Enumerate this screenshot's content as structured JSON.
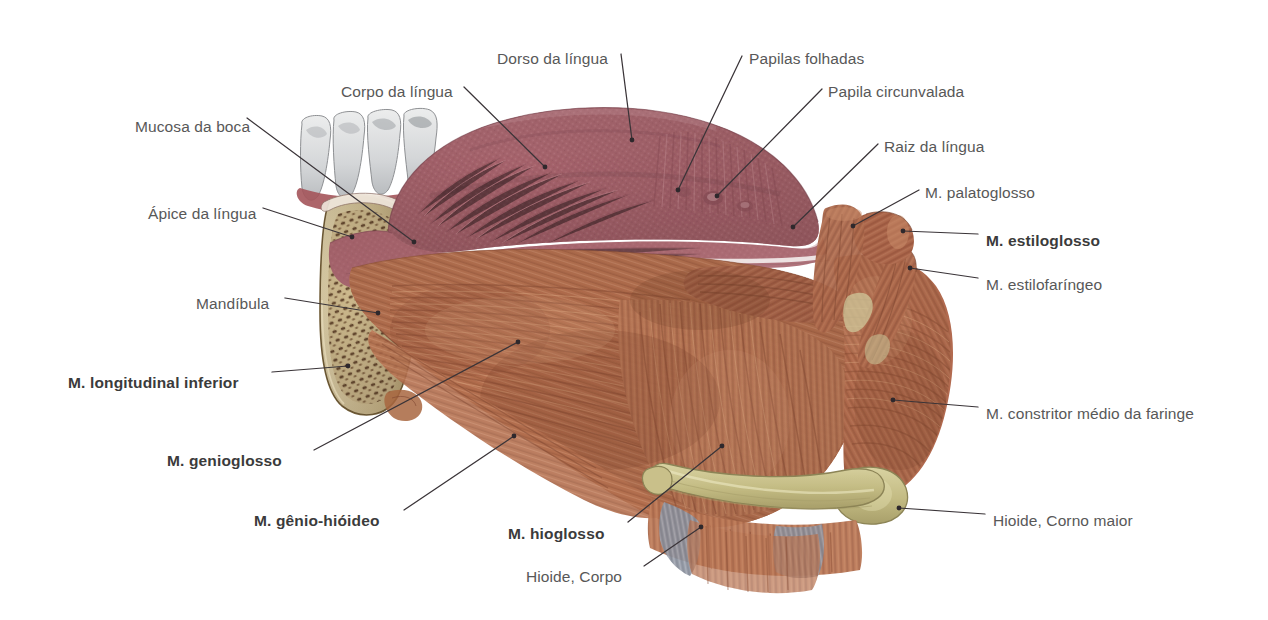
{
  "figure": {
    "language": "pt-BR",
    "background_color": "#ffffff",
    "label_color": "#585858",
    "bold_label_color": "#3b3b3b",
    "leader_line_color": "#3a3438"
  },
  "labels": [
    {
      "id": "mucosa-da-boca",
      "text": "Mucosa da boca",
      "bold": false,
      "x": 135,
      "y": 118,
      "align": "left",
      "leader": [
        [
          247,
          118
        ],
        [
          414,
          242
        ]
      ],
      "dot": true
    },
    {
      "id": "corpo-da-lingua",
      "text": "Corpo da língua",
      "bold": false,
      "x": 341,
      "y": 83,
      "align": "left",
      "leader": [
        [
          464,
          87
        ],
        [
          545,
          167
        ]
      ],
      "dot": true
    },
    {
      "id": "dorso-da-lingua",
      "text": "Dorso da língua",
      "bold": false,
      "x": 497,
      "y": 50,
      "align": "left",
      "leader": [
        [
          621,
          54
        ],
        [
          632,
          140
        ]
      ],
      "dot": true
    },
    {
      "id": "papilas-folhadas",
      "text": "Papilas folhadas",
      "bold": false,
      "x": 749,
      "y": 50,
      "align": "left",
      "leader": [
        [
          742,
          56
        ],
        [
          678,
          190
        ]
      ],
      "dot": true
    },
    {
      "id": "papila-circunvalada",
      "text": "Papila circunvalada",
      "bold": false,
      "x": 828,
      "y": 83,
      "align": "left",
      "leader": [
        [
          822,
          89
        ],
        [
          717,
          196
        ]
      ],
      "dot": true
    },
    {
      "id": "raiz-da-lingua",
      "text": "Raiz da língua",
      "bold": false,
      "x": 884,
      "y": 138,
      "align": "left",
      "leader": [
        [
          878,
          144
        ],
        [
          793,
          227
        ]
      ],
      "dot": true
    },
    {
      "id": "apice-da-lingua",
      "text": "Ápice da língua",
      "bold": false,
      "x": 148,
      "y": 205,
      "align": "left",
      "leader": [
        [
          263,
          208
        ],
        [
          352,
          237
        ]
      ],
      "dot": true
    },
    {
      "id": "m-palatoglosso",
      "text": "M. palatoglosso",
      "bold": false,
      "x": 925,
      "y": 184,
      "align": "left",
      "leader": [
        [
          919,
          190
        ],
        [
          853,
          226
        ]
      ],
      "dot": true
    },
    {
      "id": "m-estiloglosso",
      "text": "M. estiloglosso",
      "bold": true,
      "x": 986,
      "y": 232,
      "align": "left",
      "leader": [
        [
          978,
          234
        ],
        [
          903,
          231
        ]
      ],
      "dot": true
    },
    {
      "id": "m-estilofaringeo",
      "text": "M. estilofaríngeo",
      "bold": false,
      "x": 986,
      "y": 276,
      "align": "left",
      "leader": [
        [
          978,
          278
        ],
        [
          910,
          268
        ]
      ],
      "dot": true
    },
    {
      "id": "mandibula",
      "text": "Mandíbula",
      "bold": false,
      "x": 196,
      "y": 295,
      "align": "left",
      "leader": [
        [
          285,
          298
        ],
        [
          378,
          313
        ]
      ],
      "dot": true
    },
    {
      "id": "m-longitudinal-inferior",
      "text": "M. longitudinal inferior",
      "bold": true,
      "x": 68,
      "y": 374,
      "align": "left",
      "leader": [
        [
          272,
          372
        ],
        [
          348,
          366
        ]
      ],
      "dot": true
    },
    {
      "id": "m-constritor-medio",
      "text": "M. constritor médio da faringe",
      "bold": false,
      "x": 986,
      "y": 405,
      "align": "left",
      "leader": [
        [
          978,
          407
        ],
        [
          893,
          400
        ]
      ],
      "dot": true
    },
    {
      "id": "m-genioglosso",
      "text": "M. genioglosso",
      "bold": true,
      "x": 167,
      "y": 452,
      "align": "left",
      "leader": [
        [
          314,
          450
        ],
        [
          518,
          342
        ]
      ],
      "dot": true
    },
    {
      "id": "m-genio-hioideo",
      "text": "M. gênio-hióideo",
      "bold": true,
      "x": 254,
      "y": 512,
      "align": "left",
      "leader": [
        [
          404,
          510
        ],
        [
          514,
          436
        ]
      ],
      "dot": true
    },
    {
      "id": "m-hioglosso",
      "text": "M. hioglosso",
      "bold": true,
      "x": 508,
      "y": 525,
      "align": "left",
      "leader": [
        [
          628,
          522
        ],
        [
          722,
          446
        ]
      ],
      "dot": true
    },
    {
      "id": "hioide-corpo",
      "text": "Hioide, Corpo",
      "bold": false,
      "x": 526,
      "y": 568,
      "align": "left",
      "leader": [
        [
          644,
          566
        ],
        [
          701,
          527
        ]
      ],
      "dot": true
    },
    {
      "id": "hioide-corno-maior",
      "text": "Hioide, Corno maior",
      "bold": false,
      "x": 993,
      "y": 512,
      "align": "left",
      "leader": [
        [
          985,
          514
        ],
        [
          899,
          508
        ]
      ],
      "dot": true
    }
  ],
  "structures": [
    {
      "id": "teeth",
      "name": "Dentes",
      "color": "#d8d8da"
    },
    {
      "id": "mandible-cortical",
      "name": "Mandíbula (cortical)",
      "color": "#d6c49a"
    },
    {
      "id": "mandible-spongy",
      "name": "Mandíbula (esponjosa)",
      "color": "#5b3a22"
    },
    {
      "id": "tongue-dorsum",
      "name": "Dorso da língua",
      "color": "#a9636a"
    },
    {
      "id": "tongue-body",
      "name": "Corpo da língua",
      "color": "#9d5f66"
    },
    {
      "id": "muscle-fibers",
      "name": "Fibras musculares",
      "color": "#b06a4e"
    },
    {
      "id": "muscle-deep",
      "name": "Músculo profundo",
      "color": "#8d4f3a"
    },
    {
      "id": "hyoid-bone",
      "name": "Osso hioide",
      "color": "#c9c08a"
    },
    {
      "id": "tendon",
      "name": "Tendão",
      "color": "#8d93a0"
    },
    {
      "id": "pharynx-muscle",
      "name": "M. constritor da faringe",
      "color": "#b26a4f"
    }
  ]
}
